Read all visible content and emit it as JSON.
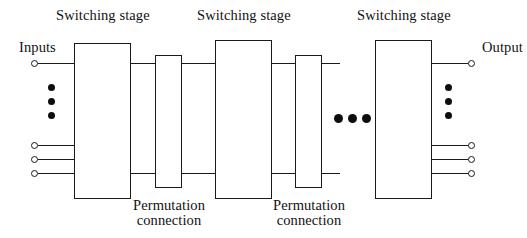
{
  "diagram": {
    "background_color": "#ffffff",
    "line_color": "#1a1a1a",
    "text_color": "#111111",
    "labels": {
      "stage1": "Switching stage",
      "stage2": "Switching stage",
      "stage3": "Switching stage",
      "inputs": "Inputs",
      "outputs": "Output",
      "perm1_line1": "Permutation",
      "perm1_line2": "connection",
      "perm2_line1": "Permutation",
      "perm2_line2": "connection"
    },
    "switching_stages": [
      {
        "name": "switching-stage-1",
        "x": 74,
        "y": 43,
        "w": 57,
        "h": 156
      },
      {
        "name": "switching-stage-2",
        "x": 215,
        "y": 40,
        "w": 57,
        "h": 159
      },
      {
        "name": "switching-stage-3",
        "x": 375,
        "y": 40,
        "w": 57,
        "h": 159
      }
    ],
    "permutation_boxes": [
      {
        "name": "permutation-connection-1",
        "x": 155,
        "y": 55,
        "w": 27,
        "h": 133
      },
      {
        "name": "permutation-connection-2",
        "x": 295,
        "y": 55,
        "w": 27,
        "h": 133
      }
    ],
    "input_terminals": [
      {
        "cy": 63
      },
      {
        "cy": 145
      },
      {
        "cy": 159
      },
      {
        "cy": 173
      }
    ],
    "output_terminals": [
      {
        "cy": 63
      },
      {
        "cy": 145
      },
      {
        "cy": 159
      },
      {
        "cy": 173
      }
    ],
    "input_vertical_dots": [
      88,
      102,
      116
    ],
    "output_vertical_dots": [
      88,
      102,
      116
    ],
    "horizontal_ellipsis_dots": [
      338,
      352,
      366
    ],
    "horizontal_ellipsis_y": 118,
    "interstage_wire_rows": [
      63,
      173
    ]
  }
}
